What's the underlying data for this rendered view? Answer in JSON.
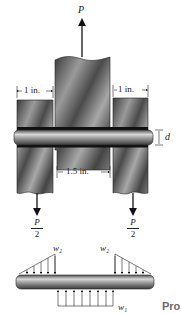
{
  "figure": {
    "load_label": "P",
    "dimensions": {
      "left_plate_width": "1 in.",
      "right_plate_width": "1 in.",
      "center_gap": "1.5 in.",
      "pin_diameter": "d"
    },
    "reactions": {
      "left": {
        "numerator": "P",
        "denominator": "2"
      },
      "right": {
        "numerator": "P",
        "denominator": "2"
      }
    },
    "free_body": {
      "left_load": "w₂",
      "right_load": "w₂",
      "center_load": "w₁"
    },
    "corner_text": "Pro"
  },
  "colors": {
    "steel_dark": "#3a3a3a",
    "steel_mid": "#8a8a8a",
    "steel_light": "#c8c8c8",
    "text": "#222222",
    "corner_text": "#6b6b6b"
  }
}
